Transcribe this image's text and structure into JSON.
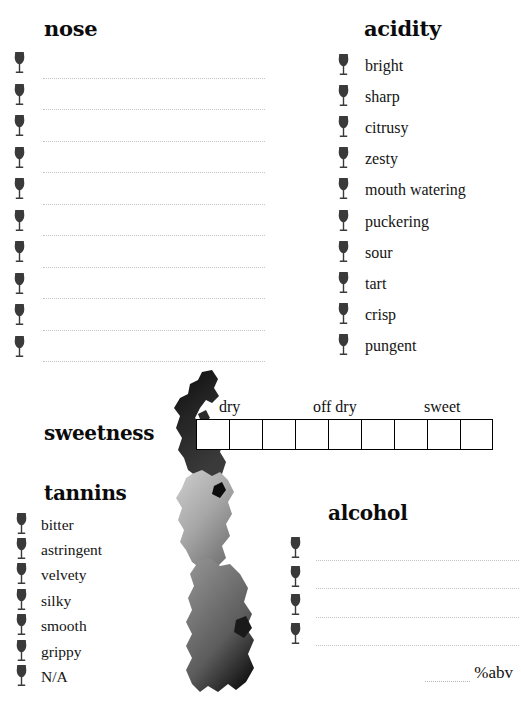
{
  "page": {
    "background_color": "#ffffff",
    "ink_color": "#0b0b0b",
    "rule_color": "#c3c3c3",
    "glass_icon_color": "#3a3a3a"
  },
  "nose": {
    "heading": "nose",
    "icon": "wine-glass-icon",
    "line_count": 10,
    "lines": [
      "",
      "",
      "",
      "",
      "",
      "",
      "",
      "",
      "",
      ""
    ]
  },
  "acidity": {
    "heading": "acidity",
    "icon": "wine-glass-icon",
    "items": [
      "bright",
      "sharp",
      "citrusy",
      "zesty",
      "mouth watering",
      "puckering",
      "sour",
      "tart",
      "crisp",
      "pungent"
    ]
  },
  "sweetness": {
    "heading": "sweetness",
    "cell_count": 9,
    "cells": [
      "",
      "",
      "",
      "",
      "",
      "",
      "",
      "",
      ""
    ],
    "tick_labels": [
      {
        "label": "dry",
        "cell_index": 1
      },
      {
        "label": "off dry",
        "cell_index": 4
      },
      {
        "label": "sweet",
        "cell_index": 7
      }
    ]
  },
  "tannins": {
    "heading": "tannins",
    "icon": "wine-glass-icon",
    "items": [
      "bitter",
      "astringent",
      "velvety",
      "silky",
      "smooth",
      "grippy",
      "N/A"
    ]
  },
  "alcohol": {
    "heading": "alcohol",
    "icon": "wine-glass-icon",
    "line_count": 4,
    "lines": [
      "",
      "",
      "",
      ""
    ],
    "abv_value": "",
    "abv_label": "%abv"
  },
  "decoration": {
    "splash": "watercolor-splash-graphic",
    "splash_tones": [
      "#0a0a0a",
      "#1c1c1c",
      "#3d3d3d",
      "#6e6e6e",
      "#9a9a9a",
      "#c4c4c4",
      "#dedede"
    ]
  }
}
